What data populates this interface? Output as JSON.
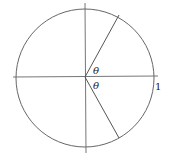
{
  "diagram": {
    "type": "unit-circle",
    "angle_label_upper": "θ",
    "angle_label_lower": "θ",
    "radius_label": "1",
    "colors": {
      "stroke": "#555555",
      "text": "#222222",
      "background": "#ffffff"
    }
  }
}
